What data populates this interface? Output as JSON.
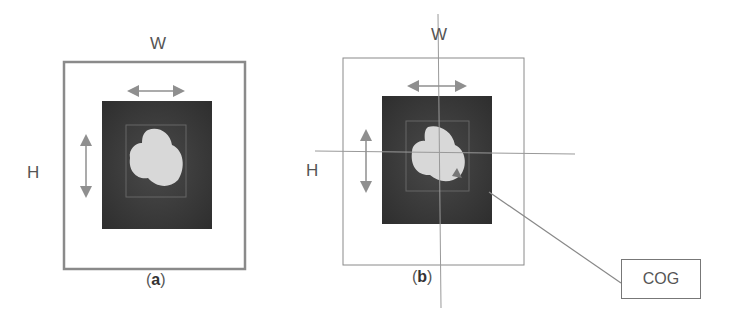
{
  "panel_a": {
    "width_label": "W",
    "height_label": "H",
    "caption_open": "(",
    "caption_letter": "a",
    "caption_close": ")"
  },
  "panel_b": {
    "width_label": "W",
    "height_label": "H",
    "caption_open": "(",
    "caption_letter": "b",
    "caption_close": ")"
  },
  "callout": {
    "label": "COG"
  },
  "colors": {
    "frame": "#8a8a8a",
    "arrow": "#8f8f8f",
    "image_bg": "#3b3b3b",
    "object": "#d8d8d8"
  }
}
